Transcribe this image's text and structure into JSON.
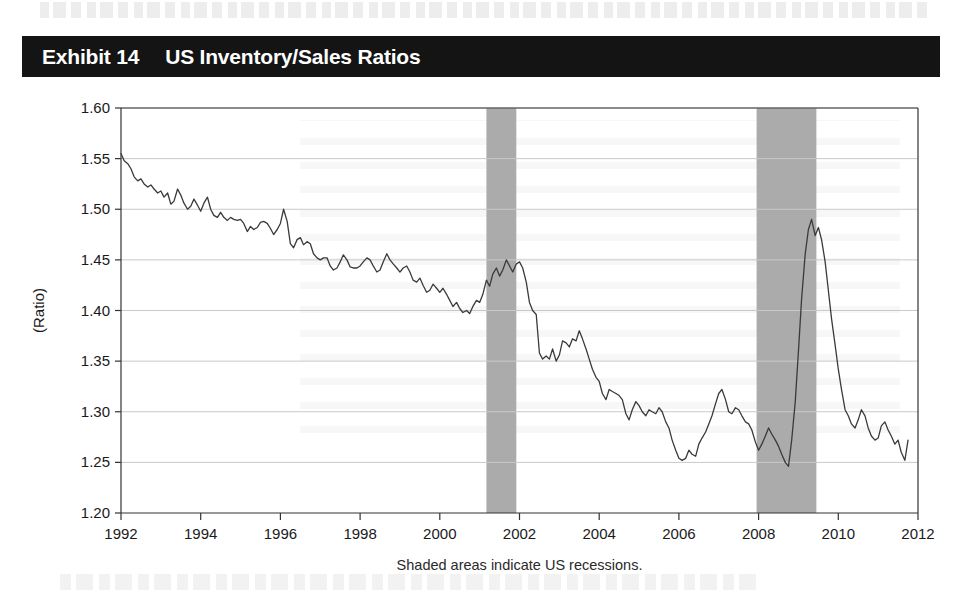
{
  "exhibit": {
    "number": "Exhibit 14",
    "title": "US Inventory/Sales Ratios"
  },
  "colors": {
    "title_bar_bg": "#141414",
    "title_text": "#ffffff",
    "line": "#3a3a3a",
    "recession_band": "#ababab",
    "gridline": "#c9c9c9",
    "axis": "#333333",
    "page_bg": "#ffffff"
  },
  "chart_data": {
    "type": "line",
    "title": "US Inventory/Sales Ratios",
    "xlabel": "",
    "ylabel": "(Ratio)",
    "note": "Shaded areas indicate US recessions.",
    "xlim": [
      1992,
      2012
    ],
    "ylim": [
      1.2,
      1.6
    ],
    "xticks": [
      1992,
      1994,
      1996,
      1998,
      2000,
      2002,
      2004,
      2006,
      2008,
      2010,
      2012
    ],
    "xtick_labels": [
      "1992",
      "1994",
      "1996",
      "1998",
      "2000",
      "2002",
      "2004",
      "2006",
      "2008",
      "2010",
      "2012"
    ],
    "yticks": [
      1.2,
      1.25,
      1.3,
      1.35,
      1.4,
      1.45,
      1.5,
      1.55,
      1.6
    ],
    "ytick_labels": [
      "1.20",
      "1.25",
      "1.30",
      "1.35",
      "1.40",
      "1.45",
      "1.50",
      "1.55",
      "1.60"
    ],
    "grid": true,
    "grid_axis": "y",
    "legend": "none",
    "shaded_regions": [
      {
        "label": "2001 US recession",
        "start": 2001.17,
        "end": 2001.92
      },
      {
        "label": "2008-2009 US recession",
        "start": 2007.95,
        "end": 2009.45
      }
    ],
    "series": [
      {
        "name": "US Inventory/Sales Ratio",
        "x": [
          1992.0,
          1992.08,
          1992.17,
          1992.25,
          1992.33,
          1992.42,
          1992.5,
          1992.58,
          1992.67,
          1992.75,
          1992.83,
          1992.92,
          1993.0,
          1993.08,
          1993.17,
          1993.25,
          1993.33,
          1993.42,
          1993.5,
          1993.58,
          1993.67,
          1993.75,
          1993.83,
          1993.92,
          1994.0,
          1994.08,
          1994.17,
          1994.25,
          1994.33,
          1994.42,
          1994.5,
          1994.58,
          1994.67,
          1994.75,
          1994.83,
          1994.92,
          1995.0,
          1995.08,
          1995.17,
          1995.25,
          1995.33,
          1995.42,
          1995.5,
          1995.58,
          1995.67,
          1995.75,
          1995.83,
          1995.92,
          1996.0,
          1996.08,
          1996.17,
          1996.25,
          1996.33,
          1996.42,
          1996.5,
          1996.58,
          1996.67,
          1996.75,
          1996.83,
          1996.92,
          1997.0,
          1997.08,
          1997.17,
          1997.25,
          1997.33,
          1997.42,
          1997.5,
          1997.58,
          1997.67,
          1997.75,
          1997.83,
          1997.92,
          1998.0,
          1998.08,
          1998.17,
          1998.25,
          1998.33,
          1998.42,
          1998.5,
          1998.58,
          1998.67,
          1998.75,
          1998.83,
          1998.92,
          1999.0,
          1999.08,
          1999.17,
          1999.25,
          1999.33,
          1999.42,
          1999.5,
          1999.58,
          1999.67,
          1999.75,
          1999.83,
          1999.92,
          2000.0,
          2000.08,
          2000.17,
          2000.25,
          2000.33,
          2000.42,
          2000.5,
          2000.58,
          2000.67,
          2000.75,
          2000.83,
          2000.92,
          2001.0,
          2001.08,
          2001.17,
          2001.25,
          2001.33,
          2001.42,
          2001.5,
          2001.58,
          2001.67,
          2001.75,
          2001.83,
          2001.92,
          2002.0,
          2002.08,
          2002.17,
          2002.25,
          2002.33,
          2002.42,
          2002.5,
          2002.58,
          2002.67,
          2002.75,
          2002.83,
          2002.92,
          2003.0,
          2003.08,
          2003.17,
          2003.25,
          2003.33,
          2003.42,
          2003.5,
          2003.58,
          2003.67,
          2003.75,
          2003.83,
          2003.92,
          2004.0,
          2004.08,
          2004.17,
          2004.25,
          2004.33,
          2004.42,
          2004.5,
          2004.58,
          2004.67,
          2004.75,
          2004.83,
          2004.92,
          2005.0,
          2005.08,
          2005.17,
          2005.25,
          2005.33,
          2005.42,
          2005.5,
          2005.58,
          2005.67,
          2005.75,
          2005.83,
          2005.92,
          2006.0,
          2006.08,
          2006.17,
          2006.25,
          2006.33,
          2006.42,
          2006.5,
          2006.58,
          2006.67,
          2006.75,
          2006.83,
          2006.92,
          2007.0,
          2007.08,
          2007.17,
          2007.25,
          2007.33,
          2007.42,
          2007.5,
          2007.58,
          2007.67,
          2007.75,
          2007.83,
          2007.92,
          2008.0,
          2008.08,
          2008.17,
          2008.25,
          2008.33,
          2008.42,
          2008.5,
          2008.58,
          2008.67,
          2008.75,
          2008.83,
          2008.92,
          2009.0,
          2009.08,
          2009.17,
          2009.25,
          2009.33,
          2009.42,
          2009.5,
          2009.58,
          2009.67,
          2009.75,
          2009.83,
          2009.92,
          2010.0,
          2010.08,
          2010.17,
          2010.25,
          2010.33,
          2010.42,
          2010.5,
          2010.58,
          2010.67,
          2010.75,
          2010.83,
          2010.92,
          2011.0,
          2011.08,
          2011.17,
          2011.25,
          2011.33,
          2011.42,
          2011.5,
          2011.58,
          2011.67,
          2011.75
        ],
        "y": [
          1.555,
          1.548,
          1.545,
          1.54,
          1.532,
          1.528,
          1.53,
          1.525,
          1.522,
          1.524,
          1.52,
          1.516,
          1.518,
          1.512,
          1.516,
          1.505,
          1.508,
          1.52,
          1.514,
          1.506,
          1.5,
          1.503,
          1.51,
          1.504,
          1.498,
          1.506,
          1.512,
          1.5,
          1.494,
          1.492,
          1.497,
          1.492,
          1.489,
          1.492,
          1.49,
          1.489,
          1.49,
          1.486,
          1.478,
          1.483,
          1.48,
          1.482,
          1.487,
          1.488,
          1.486,
          1.481,
          1.475,
          1.48,
          1.486,
          1.5,
          1.488,
          1.466,
          1.462,
          1.47,
          1.472,
          1.465,
          1.468,
          1.466,
          1.456,
          1.452,
          1.45,
          1.452,
          1.452,
          1.444,
          1.44,
          1.442,
          1.448,
          1.455,
          1.45,
          1.443,
          1.442,
          1.442,
          1.444,
          1.448,
          1.452,
          1.45,
          1.444,
          1.438,
          1.44,
          1.448,
          1.456,
          1.45,
          1.446,
          1.442,
          1.438,
          1.442,
          1.444,
          1.438,
          1.43,
          1.428,
          1.432,
          1.425,
          1.418,
          1.42,
          1.426,
          1.422,
          1.418,
          1.422,
          1.416,
          1.41,
          1.404,
          1.408,
          1.402,
          1.398,
          1.4,
          1.397,
          1.404,
          1.41,
          1.408,
          1.416,
          1.43,
          1.424,
          1.436,
          1.442,
          1.434,
          1.44,
          1.45,
          1.444,
          1.438,
          1.446,
          1.448,
          1.442,
          1.428,
          1.408,
          1.4,
          1.396,
          1.358,
          1.352,
          1.355,
          1.352,
          1.362,
          1.35,
          1.356,
          1.37,
          1.368,
          1.364,
          1.372,
          1.37,
          1.38,
          1.372,
          1.362,
          1.352,
          1.342,
          1.334,
          1.33,
          1.318,
          1.312,
          1.322,
          1.32,
          1.318,
          1.316,
          1.312,
          1.298,
          1.292,
          1.302,
          1.31,
          1.306,
          1.3,
          1.296,
          1.302,
          1.3,
          1.298,
          1.304,
          1.3,
          1.29,
          1.284,
          1.272,
          1.262,
          1.254,
          1.252,
          1.254,
          1.262,
          1.258,
          1.256,
          1.268,
          1.274,
          1.28,
          1.288,
          1.296,
          1.308,
          1.318,
          1.322,
          1.312,
          1.3,
          1.298,
          1.304,
          1.302,
          1.296,
          1.29,
          1.288,
          1.282,
          1.27,
          1.262,
          1.268,
          1.276,
          1.284,
          1.278,
          1.272,
          1.266,
          1.258,
          1.25,
          1.246,
          1.272,
          1.31,
          1.36,
          1.412,
          1.456,
          1.48,
          1.49,
          1.474,
          1.482,
          1.47,
          1.448,
          1.42,
          1.392,
          1.366,
          1.342,
          1.322,
          1.302,
          1.296,
          1.288,
          1.284,
          1.292,
          1.302,
          1.296,
          1.284,
          1.276,
          1.272,
          1.274,
          1.286,
          1.29,
          1.282,
          1.276,
          1.268,
          1.272,
          1.26,
          1.252,
          1.272
        ]
      }
    ]
  }
}
